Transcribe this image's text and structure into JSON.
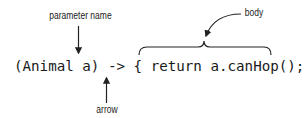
{
  "diagram": {
    "code_line": "(Animal a) -> { return a.canHop(); }",
    "labels": {
      "parameter_name": "parameter name",
      "arrow": "arrow",
      "body": "body"
    },
    "colors": {
      "text": "#1a1a1a",
      "lines": "#222222",
      "background": "#ffffff"
    }
  }
}
